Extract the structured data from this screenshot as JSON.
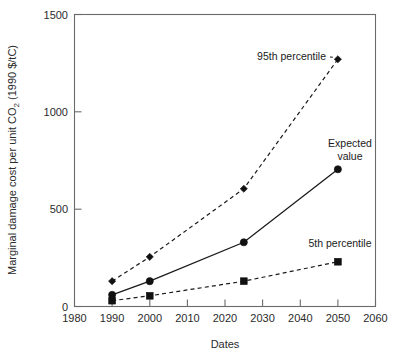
{
  "chart_data": {
    "type": "line",
    "title": "",
    "xlabel": "Dates",
    "ylabel": "Marginal damage cost per unit CO2 (1990 $/tC)",
    "ylabel_parts": {
      "before": "Marginal damage cost per unit CO",
      "subscript": "2",
      "after": " (1990 $/tC)"
    },
    "xlim": [
      1980,
      2060
    ],
    "ylim": [
      0,
      1500
    ],
    "xticks": [
      1980,
      1990,
      2000,
      2010,
      2020,
      2030,
      2040,
      2050,
      2060
    ],
    "xtick_labels": [
      "1980",
      "1990",
      "2000",
      "2010",
      "2020",
      "2030",
      "2040",
      "2050",
      "2060"
    ],
    "yticks": [
      0,
      500,
      1000,
      1500
    ],
    "ytick_labels": [
      "0",
      "500",
      "1000",
      "1500"
    ],
    "grid": false,
    "legend_position": "inline-annotations",
    "x": [
      1990,
      2000,
      2025,
      2050
    ],
    "series": [
      {
        "name": "95th percentile",
        "values": [
          130,
          255,
          605,
          1270
        ],
        "style": "dashed",
        "marker": "diamond",
        "color": "#111111"
      },
      {
        "name": "Expected value",
        "values": [
          60,
          130,
          330,
          705
        ],
        "style": "solid",
        "marker": "circle",
        "color": "#111111"
      },
      {
        "name": "5th percentile",
        "values": [
          30,
          55,
          130,
          230
        ],
        "style": "dashed",
        "marker": "square",
        "color": "#111111"
      }
    ],
    "annotations": [
      {
        "text": "95th percentile",
        "x": 2035,
        "y": 1290,
        "anchor": "end"
      },
      {
        "text": "Expected",
        "x": 2048,
        "y": 860,
        "anchor": "middle"
      },
      {
        "text": "value",
        "x": 2048,
        "y": 790,
        "anchor": "middle"
      },
      {
        "text": "5th percentile",
        "x": 2052,
        "y": 330,
        "anchor": "middle"
      }
    ]
  },
  "colors": {
    "ink": "#111111",
    "axis": "#6b6b6b",
    "background": "#ffffff"
  }
}
